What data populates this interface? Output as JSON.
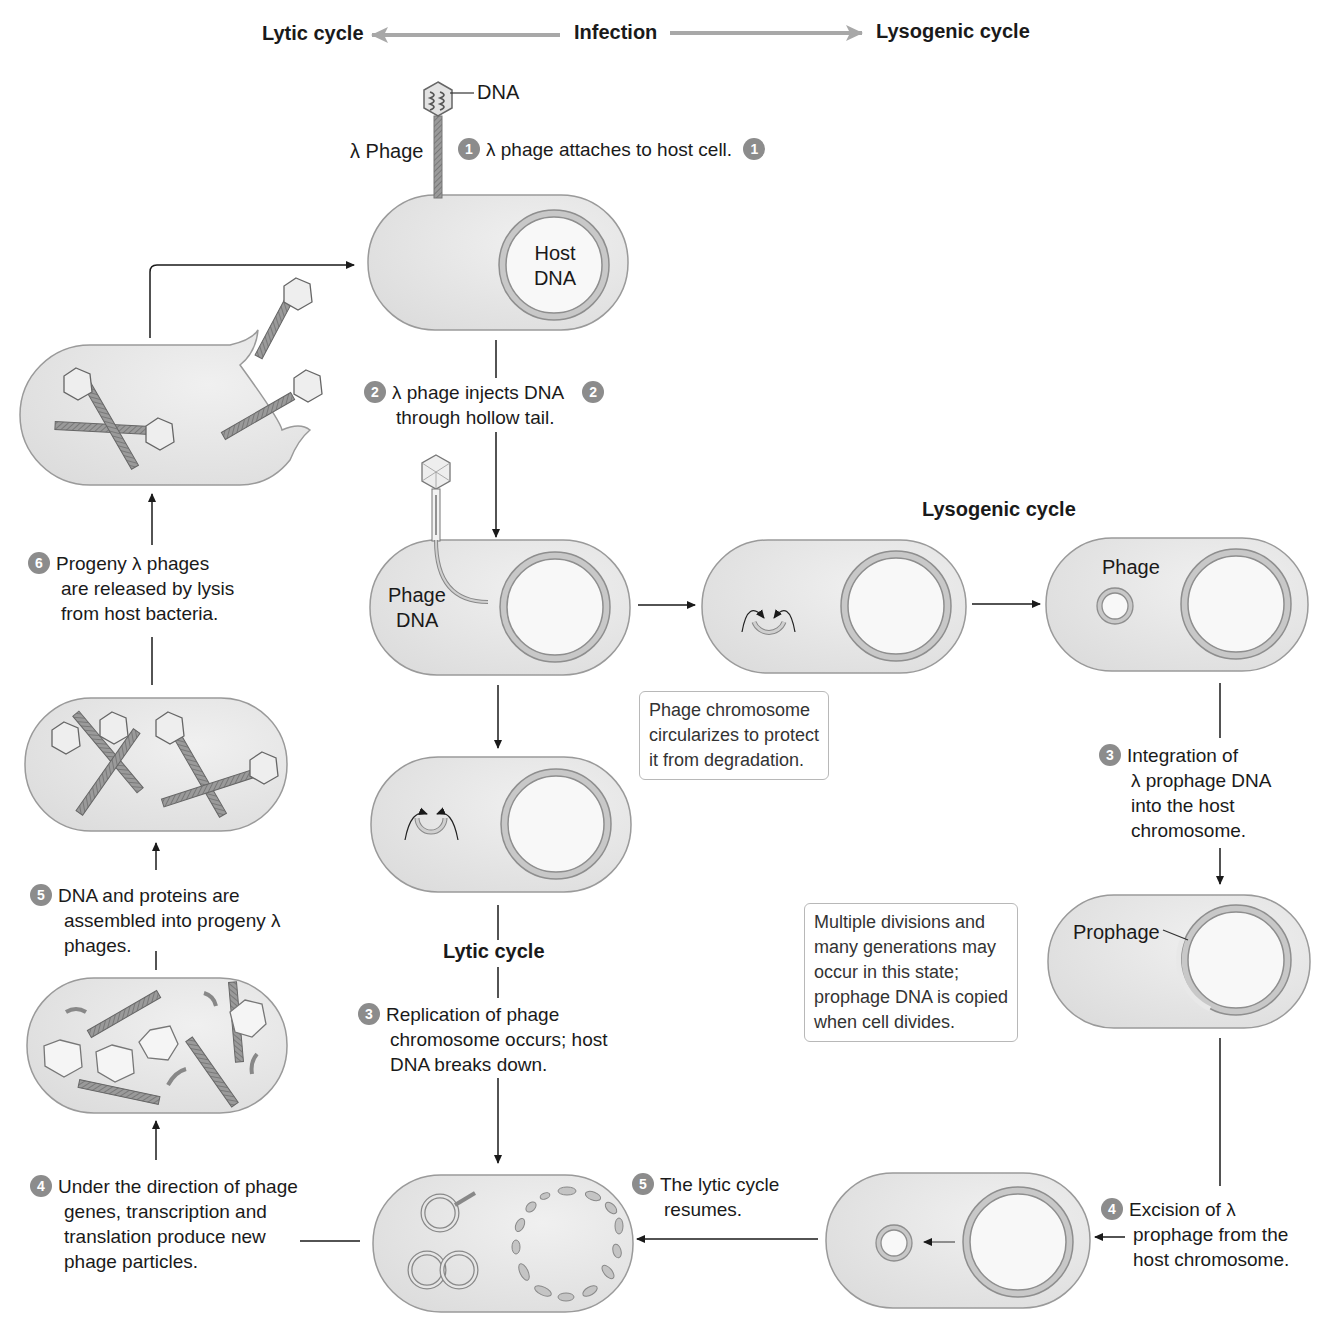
{
  "header": {
    "left": "Lytic cycle",
    "center": "Infection",
    "right": "Lysogenic cycle"
  },
  "labels": {
    "dna": "DNA",
    "lambda_phage": "λ Phage",
    "host_dna_line1": "Host",
    "host_dna_line2": "DNA",
    "phage_dna_line1": "Phage",
    "phage_dna_line2": "DNA",
    "phage": "Phage",
    "prophage": "Prophage",
    "lysogenic_section": "Lysogenic cycle",
    "lytic_section": "Lytic cycle"
  },
  "steps": {
    "infection_1": {
      "num": "1",
      "text": "λ phage attaches to host cell.",
      "num_right": "1"
    },
    "infection_2": {
      "num": "2",
      "lines": [
        "λ phage injects DNA",
        "through hollow tail."
      ],
      "num_right": "2"
    },
    "lytic_3": {
      "num": "3",
      "lines": [
        "Replication of phage",
        "chromosome occurs; host",
        "DNA breaks down."
      ]
    },
    "lytic_4": {
      "num": "4",
      "lines": [
        "Under the direction of phage",
        "genes, transcription and",
        "translation produce new",
        "phage particles."
      ]
    },
    "lytic_5": {
      "num": "5",
      "lines": [
        "DNA and proteins are",
        "assembled into progeny λ",
        "phages."
      ]
    },
    "lytic_6": {
      "num": "6",
      "lines": [
        "Progeny λ phages",
        "are released by lysis",
        "from host bacteria."
      ]
    },
    "lyso_3": {
      "num": "3",
      "lines": [
        "Integration of",
        "λ prophage DNA",
        "into the host",
        "chromosome."
      ]
    },
    "lyso_4": {
      "num": "4",
      "lines": [
        "Excision of λ",
        "prophage from the",
        "host chromosome."
      ]
    },
    "lyso_5": {
      "num": "5",
      "lines": [
        "The lytic cycle",
        "resumes."
      ]
    }
  },
  "notes": {
    "circularize": [
      "Phage chromosome",
      "circularizes to protect",
      "it from degradation."
    ],
    "divisions": [
      "Multiple divisions and",
      "many generations may",
      "occur in this state;",
      "prophage DNA is copied",
      "when cell divides."
    ]
  },
  "colors": {
    "cell_fill": "#e6e6e6",
    "cell_stroke": "#9a9a9a",
    "badge": "#8c8c8c",
    "header_arrow": "#a8a8a8",
    "arrow": "#1a1a1a"
  }
}
